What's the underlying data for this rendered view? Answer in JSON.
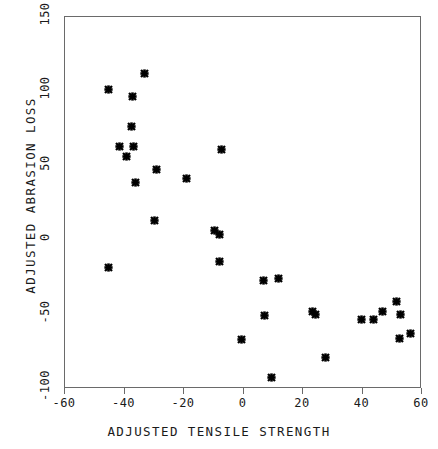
{
  "chart_data": {
    "type": "scatter",
    "title": "",
    "xlabel": "ADJUSTED TENSILE STRENGTH",
    "ylabel": "ADJUSTED ABRASION LOSS",
    "xlim": [
      -60,
      60
    ],
    "ylim": [
      -100,
      150
    ],
    "xticks": [
      -60,
      -40,
      -20,
      0,
      20,
      40,
      60
    ],
    "yticks": [
      -100,
      -50,
      0,
      50,
      100,
      150
    ],
    "xtick_labels": [
      "-60",
      "-40",
      "-20",
      "0",
      "20",
      "40",
      "60"
    ],
    "ytick_labels": [
      "-100",
      "-50",
      "0",
      "50",
      "100",
      "150"
    ],
    "grid": false,
    "legend": false,
    "marker": "asterisk",
    "marker_color": "#000000",
    "frame_color": "#6a6a6a",
    "points": [
      {
        "x": -45.3,
        "y": 101.6
      },
      {
        "x": -33.4,
        "y": 111.7
      },
      {
        "x": -37.4,
        "y": 96.9
      },
      {
        "x": -37.7,
        "y": 76.7
      },
      {
        "x": -41.8,
        "y": 63.0
      },
      {
        "x": -37.1,
        "y": 63.0
      },
      {
        "x": -39.4,
        "y": 56.3
      },
      {
        "x": -7.4,
        "y": 61.0
      },
      {
        "x": -29.1,
        "y": 47.6
      },
      {
        "x": -19.2,
        "y": 41.5
      },
      {
        "x": -36.3,
        "y": 38.5
      },
      {
        "x": -29.9,
        "y": 13.2
      },
      {
        "x": -9.9,
        "y": 6.5
      },
      {
        "x": -8.2,
        "y": 4.0
      },
      {
        "x": -8.0,
        "y": -14.0
      },
      {
        "x": -45.4,
        "y": -18.1
      },
      {
        "x": 6.6,
        "y": -26.8
      },
      {
        "x": 11.9,
        "y": -25.5
      },
      {
        "x": 6.9,
        "y": -50.3
      },
      {
        "x": 23.1,
        "y": -48.0
      },
      {
        "x": 24.1,
        "y": -50.0
      },
      {
        "x": 39.7,
        "y": -53.0
      },
      {
        "x": 43.7,
        "y": -53.0
      },
      {
        "x": 46.6,
        "y": -48.0
      },
      {
        "x": 51.4,
        "y": -41.0
      },
      {
        "x": 52.8,
        "y": -50.0
      },
      {
        "x": 52.6,
        "y": -66.0
      },
      {
        "x": 56.0,
        "y": -63.0
      },
      {
        "x": -0.8,
        "y": -66.5
      },
      {
        "x": 27.6,
        "y": -78.5
      },
      {
        "x": 9.3,
        "y": -92.5
      }
    ]
  },
  "figure": {
    "background_color": "#ffffff",
    "point_count": 31
  }
}
